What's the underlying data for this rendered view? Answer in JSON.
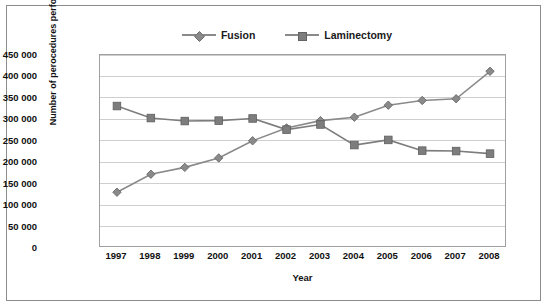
{
  "legend": {
    "items": [
      {
        "label": "Fusion",
        "marker": "diamond",
        "color": "#8a8a8a"
      },
      {
        "label": "Laminectomy",
        "marker": "square",
        "color": "#7d7d7d"
      }
    ]
  },
  "axes": {
    "x_title": "Year",
    "y_title": "Number of perocedures performed"
  },
  "chart_data": {
    "type": "line",
    "title": "",
    "xlabel": "Year",
    "ylabel": "Number of perocedures performed",
    "categories": [
      "1997",
      "1998",
      "1999",
      "2000",
      "2001",
      "2002",
      "2003",
      "2004",
      "2005",
      "2006",
      "2007",
      "2008"
    ],
    "ylim": [
      0,
      450000
    ],
    "yticks": [
      0,
      50000,
      100000,
      150000,
      200000,
      250000,
      300000,
      350000,
      400000,
      450000
    ],
    "ytick_labels": [
      "0",
      "50 000",
      "100 000",
      "150 000",
      "200 000",
      "250 000",
      "300 000",
      "350 000",
      "400 000",
      "450 000"
    ],
    "grid": true,
    "legend_position": "top",
    "series": [
      {
        "name": "Fusion",
        "marker": "diamond",
        "color": "#8a8a8a",
        "values": [
          130000,
          172000,
          188000,
          210000,
          250000,
          280000,
          297000,
          305000,
          333000,
          344000,
          348000,
          412000
        ]
      },
      {
        "name": "Laminectomy",
        "marker": "square",
        "color": "#7d7d7d",
        "values": [
          331000,
          303000,
          296000,
          297000,
          302000,
          276000,
          288000,
          240000,
          252000,
          227000,
          226000,
          220000
        ]
      }
    ]
  }
}
